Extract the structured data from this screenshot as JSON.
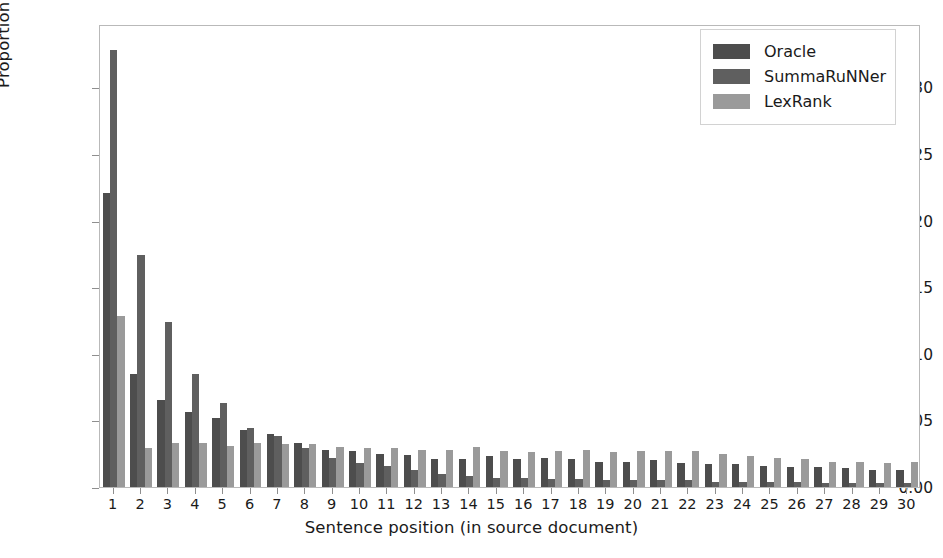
{
  "chart_data": {
    "type": "bar",
    "title": "",
    "xlabel": "Sentence position (in source document)",
    "ylabel": "Proportion of selected sentences",
    "categories": [
      "1",
      "2",
      "3",
      "4",
      "5",
      "6",
      "7",
      "8",
      "9",
      "10",
      "11",
      "12",
      "13",
      "14",
      "15",
      "16",
      "17",
      "18",
      "19",
      "20",
      "21",
      "22",
      "23",
      "24",
      "25",
      "26",
      "27",
      "28",
      "29",
      "30"
    ],
    "ytick_labels": [
      "0.00",
      "0.05",
      "0.10",
      "0.15",
      "0.20",
      "0.25",
      "0.30"
    ],
    "ytick_values": [
      0.0,
      0.05,
      0.1,
      0.15,
      0.2,
      0.25,
      0.3
    ],
    "ylim": [
      0.0,
      0.3475
    ],
    "xlim": [
      0.5,
      30.5
    ],
    "grid": false,
    "legend_position": "upper right",
    "series": [
      {
        "name": "Oracle",
        "color": "#4d4d4d",
        "values": [
          0.221,
          0.085,
          0.065,
          0.056,
          0.052,
          0.043,
          0.04,
          0.033,
          0.028,
          0.027,
          0.025,
          0.024,
          0.021,
          0.021,
          0.023,
          0.021,
          0.022,
          0.021,
          0.019,
          0.019,
          0.02,
          0.018,
          0.017,
          0.017,
          0.016,
          0.015,
          0.015,
          0.014,
          0.013,
          0.013
        ]
      },
      {
        "name": "SummaRuNNer",
        "color": "#5f5f5f",
        "values": [
          0.328,
          0.174,
          0.124,
          0.085,
          0.063,
          0.044,
          0.038,
          0.029,
          0.022,
          0.018,
          0.016,
          0.013,
          0.01,
          0.008,
          0.007,
          0.007,
          0.006,
          0.006,
          0.005,
          0.005,
          0.005,
          0.005,
          0.004,
          0.004,
          0.004,
          0.004,
          0.003,
          0.003,
          0.003,
          0.003
        ]
      },
      {
        "name": "LexRank",
        "color": "#9a9a9a",
        "values": [
          0.128,
          0.029,
          0.033,
          0.033,
          0.031,
          0.033,
          0.032,
          0.032,
          0.03,
          0.029,
          0.029,
          0.028,
          0.028,
          0.03,
          0.027,
          0.026,
          0.027,
          0.028,
          0.026,
          0.027,
          0.027,
          0.027,
          0.025,
          0.023,
          0.022,
          0.021,
          0.019,
          0.019,
          0.018,
          0.019
        ]
      }
    ]
  },
  "legend": {
    "items": [
      {
        "label": "Oracle",
        "color": "#4d4d4d"
      },
      {
        "label": "SummaRuNNer",
        "color": "#5f5f5f"
      },
      {
        "label": "LexRank",
        "color": "#9a9a9a"
      }
    ]
  },
  "axes": {
    "x_label": "Sentence position (in source document)",
    "y_label": "Proportion of selected sentences"
  },
  "style": {
    "background": "#ffffff",
    "frame_color": "#b9b9b9",
    "text_color": "#1a1a1a"
  }
}
